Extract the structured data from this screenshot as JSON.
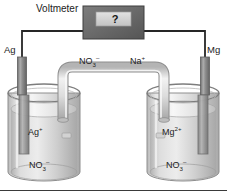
{
  "figure": {
    "device": {
      "label": "Voltmeter",
      "display_value": "?"
    },
    "electrodes": [
      {
        "id": "left",
        "label": "Ag",
        "name": "silver-electrode"
      },
      {
        "id": "right",
        "label": "Mg",
        "name": "magnesium-electrode"
      }
    ],
    "salt_bridge": {
      "ion_left": "NO",
      "ion_left_sub": "3",
      "ion_left_sup": "–",
      "ion_right": "Na",
      "ion_right_sup": "+"
    },
    "beakers": [
      {
        "id": "left",
        "cation": "Ag",
        "cation_sup": "+",
        "anion": "NO",
        "anion_sub": "3",
        "anion_sup": "–"
      },
      {
        "id": "right",
        "cation": "Mg",
        "cation_sup": "2+",
        "anion": "NO",
        "anion_sub": "3",
        "anion_sup": "–"
      }
    ]
  },
  "colors": {
    "wire": "#262626",
    "voltmeter_body": "#6e6e6e",
    "voltmeter_screen": "#d3d3d3",
    "glass": "#cfcfcf",
    "solution": "#c8c8c8",
    "metal": "#9a9a9a",
    "background": "#ffffff",
    "text": "#1c1c1c"
  }
}
